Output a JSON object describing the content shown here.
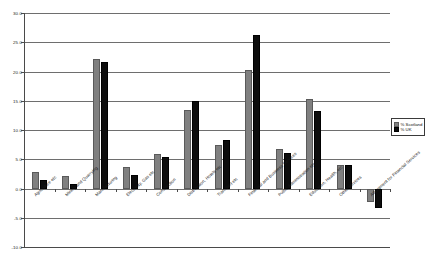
{
  "chart_data": {
    "type": "bar",
    "title": "",
    "xlabel": "",
    "ylabel": "",
    "ylim": [
      -10.0,
      30.0
    ],
    "ytick_step": 5.0,
    "ytick_labels": [
      "30.0",
      "25.0",
      "20.0",
      "15.0",
      "10.0",
      "5.0",
      "0.0",
      "-5.0",
      "-10.0"
    ],
    "ytick_values": [
      30.0,
      25.0,
      20.0,
      15.0,
      10.0,
      5.0,
      0.0,
      -5.0,
      -10.0
    ],
    "grid": true,
    "legend_position": "right",
    "categories": [
      "Agriculture etc",
      "Mining and Quarrying",
      "Manufacturing",
      "Electricity, Gas etc",
      "Construction",
      "Distribution, Hotels etc",
      "Transport etc",
      "Financial and Business Services",
      "Public Administration etc",
      "Education, Health, etc",
      "Other services",
      "Adjustment for Financial Services"
    ],
    "series": [
      {
        "name": "% Scotland",
        "color": "#808080",
        "values": [
          2.8,
          2.1,
          22.2,
          3.7,
          5.9,
          13.4,
          7.5,
          20.2,
          6.8,
          15.3,
          4.0,
          -2.3
        ]
      },
      {
        "name": "% UK",
        "color": "#0d0d0d",
        "values": [
          1.5,
          0.8,
          21.7,
          2.3,
          5.4,
          15.0,
          8.3,
          26.2,
          6.1,
          13.2,
          4.0,
          -3.3
        ]
      }
    ]
  },
  "legend": {
    "items": [
      {
        "label": "% Scotland"
      },
      {
        "label": "% UK"
      }
    ]
  }
}
